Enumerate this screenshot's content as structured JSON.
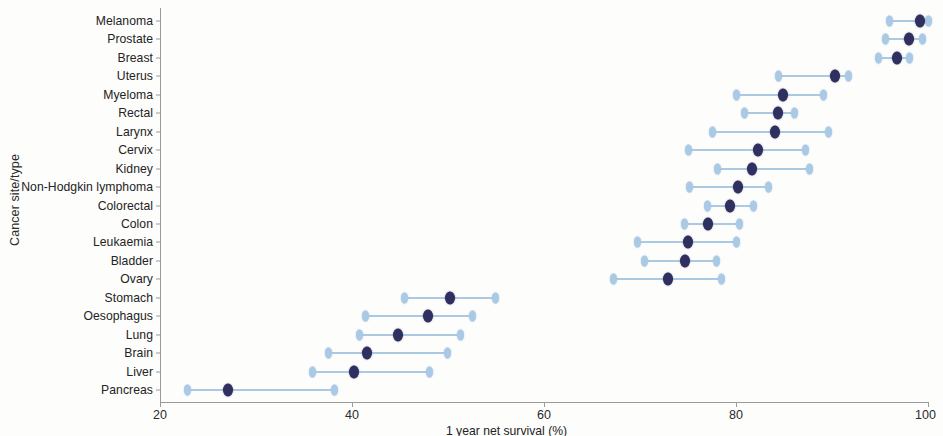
{
  "chart_data": {
    "type": "scatter",
    "title": "",
    "xlabel": "1 year net survival (%)",
    "ylabel": "Cancer site/type",
    "xlim": [
      20,
      100
    ],
    "xticks": [
      20,
      40,
      60,
      80,
      100
    ],
    "grid": false,
    "legend": null,
    "marker_colors": {
      "estimate": "#2f2f60",
      "interval": "#a9c9e4"
    },
    "series_names": [
      "Lower limit",
      "Estimate",
      "Upper limit"
    ],
    "categories": [
      "Melanoma",
      "Prostate",
      "Breast",
      "Uterus",
      "Myeloma",
      "Rectal",
      "Larynx",
      "Cervix",
      "Kidney",
      "Non-Hodgkin lymphoma",
      "Colorectal",
      "Colon",
      "Leukaemia",
      "Bladder",
      "Ovary",
      "Stomach",
      "Oesophagus",
      "Lung",
      "Brain",
      "Liver",
      "Pancreas"
    ],
    "points": [
      {
        "label": "Melanoma",
        "low": 96.0,
        "value": 99.2,
        "high": 100.0
      },
      {
        "label": "Prostate",
        "low": 95.6,
        "value": 98.0,
        "high": 99.4
      },
      {
        "label": "Breast",
        "low": 94.8,
        "value": 96.8,
        "high": 98.1
      },
      {
        "label": "Uterus",
        "low": 84.4,
        "value": 90.3,
        "high": 91.7
      },
      {
        "label": "Myeloma",
        "low": 80.1,
        "value": 84.9,
        "high": 89.1
      },
      {
        "label": "Rectal",
        "low": 80.9,
        "value": 84.4,
        "high": 86.1
      },
      {
        "label": "Larynx",
        "low": 77.5,
        "value": 84.1,
        "high": 89.6
      },
      {
        "label": "Cervix",
        "low": 75.0,
        "value": 82.3,
        "high": 87.2
      },
      {
        "label": "Kidney",
        "low": 78.1,
        "value": 81.7,
        "high": 87.7
      },
      {
        "label": "Non-Hodgkin lymphoma",
        "low": 75.2,
        "value": 80.2,
        "high": 83.4
      },
      {
        "label": "Colorectal",
        "low": 77.0,
        "value": 79.4,
        "high": 81.8
      },
      {
        "label": "Colon",
        "low": 74.6,
        "value": 77.1,
        "high": 80.4
      },
      {
        "label": "Leukaemia",
        "low": 69.7,
        "value": 75.0,
        "high": 80.1
      },
      {
        "label": "Bladder",
        "low": 70.5,
        "value": 74.7,
        "high": 78.0
      },
      {
        "label": "Ovary",
        "low": 67.2,
        "value": 72.9,
        "high": 78.5
      },
      {
        "label": "Stomach",
        "low": 45.5,
        "value": 50.2,
        "high": 54.9
      },
      {
        "label": "Oesophagus",
        "low": 41.4,
        "value": 47.9,
        "high": 52.6
      },
      {
        "label": "Lung",
        "low": 40.8,
        "value": 44.8,
        "high": 51.3
      },
      {
        "label": "Brain",
        "low": 37.5,
        "value": 41.6,
        "high": 49.9
      },
      {
        "label": "Liver",
        "low": 35.9,
        "value": 40.2,
        "high": 48.1
      },
      {
        "label": "Pancreas",
        "low": 22.9,
        "value": 27.1,
        "high": 38.2
      }
    ]
  }
}
